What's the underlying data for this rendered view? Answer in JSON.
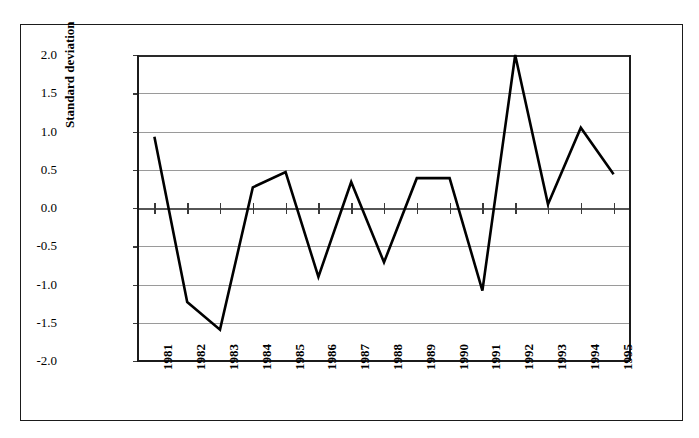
{
  "figure": {
    "frame_color": "#1b1b1b",
    "background": "#ffffff"
  },
  "axes": {
    "y_title": "Standard deviation",
    "y_ticks": [
      "2.0",
      "1.5",
      "1.0",
      "0.5",
      "0.0",
      "-0.5",
      "-1.0",
      "-1.5",
      "-2.0"
    ],
    "y_min": -2.0,
    "y_max": 2.0,
    "x_ticks": [
      "1981",
      "1982",
      "1983",
      "1984",
      "1985",
      "1986",
      "1987",
      "1988",
      "1989",
      "1990",
      "1991",
      "1992",
      "1993",
      "1994",
      "1995"
    ]
  },
  "chart_data": {
    "type": "line",
    "title": "",
    "xlabel": "",
    "ylabel": "Standard deviation",
    "categories": [
      "1981",
      "1982",
      "1983",
      "1984",
      "1985",
      "1986",
      "1987",
      "1988",
      "1989",
      "1990",
      "1991",
      "1992",
      "1993",
      "1994",
      "1995"
    ],
    "values": [
      0.93,
      -1.23,
      -1.59,
      0.27,
      0.47,
      -0.9,
      0.34,
      -0.71,
      0.39,
      0.39,
      -1.08,
      2.0,
      0.05,
      1.05,
      0.44
    ],
    "series": [
      {
        "name": "Standard deviation",
        "values": [
          0.93,
          -1.23,
          -1.59,
          0.27,
          0.47,
          -0.9,
          0.34,
          -0.71,
          0.39,
          0.39,
          -1.08,
          2.0,
          0.05,
          1.05,
          0.44
        ]
      }
    ],
    "ylim": [
      -2.0,
      2.0
    ],
    "ytick_step": 0.5,
    "grid": true,
    "grid_axis": "y",
    "legend": false,
    "legend_position": "none",
    "line_color": "#000000",
    "line_width": 2.6,
    "markers": false
  }
}
